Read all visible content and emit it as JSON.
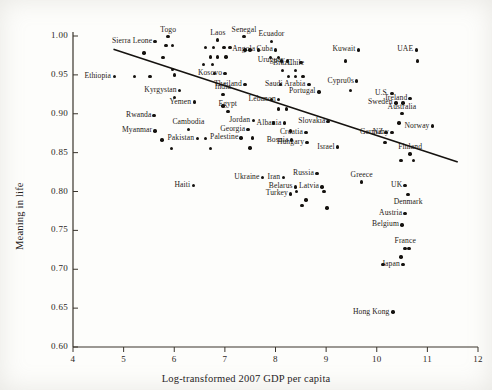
{
  "chart_data": {
    "type": "scatter",
    "title": "",
    "xlabel": "Log-transformed 2007 GDP per capita",
    "ylabel": "Meaning in life",
    "xlim": [
      4,
      12
    ],
    "ylim": [
      0.6,
      1.0
    ],
    "xticks": [
      "4",
      "5",
      "6",
      "7",
      "8",
      "9",
      "10",
      "11",
      "12"
    ],
    "yticks": [
      "0.60",
      "0.65",
      "0.70",
      "0.75",
      "0.80",
      "0.85",
      "0.90",
      "0.95",
      "1.00"
    ],
    "grid": false,
    "legend": "none",
    "trendline": {
      "x0": 4.8,
      "y0": 0.983,
      "x1": 11.6,
      "y1": 0.838,
      "color": "#15120f"
    },
    "points": [
      {
        "label": "Ethiopia",
        "x": 4.82,
        "y": 0.948,
        "lp": "left"
      },
      {
        "label": "",
        "x": 5.22,
        "y": 0.948,
        "lp": "none"
      },
      {
        "label": "",
        "x": 5.52,
        "y": 0.948,
        "lp": "none"
      },
      {
        "label": "Sierra Leone",
        "x": 5.62,
        "y": 0.993,
        "lp": "left"
      },
      {
        "label": "Togo",
        "x": 5.88,
        "y": 0.999,
        "lp": "top"
      },
      {
        "label": "",
        "x": 5.84,
        "y": 0.988,
        "lp": "none"
      },
      {
        "label": "",
        "x": 5.96,
        "y": 0.988,
        "lp": "none"
      },
      {
        "label": "",
        "x": 5.4,
        "y": 0.978,
        "lp": "none"
      },
      {
        "label": "",
        "x": 5.78,
        "y": 0.972,
        "lp": "none"
      },
      {
        "label": "",
        "x": 5.96,
        "y": 0.957,
        "lp": "none"
      },
      {
        "label": "",
        "x": 6.0,
        "y": 0.95,
        "lp": "none"
      },
      {
        "label": "Kyrgystan",
        "x": 6.1,
        "y": 0.93,
        "lp": "left"
      },
      {
        "label": "",
        "x": 6.0,
        "y": 0.921,
        "lp": "none"
      },
      {
        "label": "Yemen",
        "x": 6.4,
        "y": 0.915,
        "lp": "left"
      },
      {
        "label": "Rwanda",
        "x": 5.6,
        "y": 0.898,
        "lp": "left"
      },
      {
        "label": "Myanmar",
        "x": 5.62,
        "y": 0.878,
        "lp": "left"
      },
      {
        "label": "",
        "x": 5.76,
        "y": 0.866,
        "lp": "none"
      },
      {
        "label": "",
        "x": 5.94,
        "y": 0.855,
        "lp": "none"
      },
      {
        "label": "Cambodia",
        "x": 6.28,
        "y": 0.88,
        "lp": "top"
      },
      {
        "label": "Pakistan",
        "x": 6.46,
        "y": 0.868,
        "lp": "left"
      },
      {
        "label": "",
        "x": 6.62,
        "y": 0.868,
        "lp": "none"
      },
      {
        "label": "",
        "x": 6.72,
        "y": 0.855,
        "lp": "none"
      },
      {
        "label": "Haiti",
        "x": 6.38,
        "y": 0.808,
        "lp": "left"
      },
      {
        "label": "Laos",
        "x": 6.86,
        "y": 0.995,
        "lp": "top"
      },
      {
        "label": "",
        "x": 6.62,
        "y": 0.985,
        "lp": "none"
      },
      {
        "label": "",
        "x": 6.78,
        "y": 0.985,
        "lp": "none"
      },
      {
        "label": "",
        "x": 6.98,
        "y": 0.985,
        "lp": "none"
      },
      {
        "label": "",
        "x": 7.1,
        "y": 0.985,
        "lp": "none"
      },
      {
        "label": "",
        "x": 6.72,
        "y": 0.973,
        "lp": "none"
      },
      {
        "label": "",
        "x": 6.86,
        "y": 0.973,
        "lp": "none"
      },
      {
        "label": "",
        "x": 7.02,
        "y": 0.973,
        "lp": "none"
      },
      {
        "label": "",
        "x": 6.58,
        "y": 0.963,
        "lp": "none"
      },
      {
        "label": "",
        "x": 6.76,
        "y": 0.963,
        "lp": "none"
      },
      {
        "label": "Kosovo",
        "x": 7.0,
        "y": 0.952,
        "lp": "left"
      },
      {
        "label": "",
        "x": 6.8,
        "y": 0.952,
        "lp": "none"
      },
      {
        "label": "Thailand",
        "x": 7.4,
        "y": 0.938,
        "lp": "left"
      },
      {
        "label": "India",
        "x": 6.96,
        "y": 0.925,
        "lp": "top"
      },
      {
        "label": "",
        "x": 6.96,
        "y": 0.91,
        "lp": "none"
      },
      {
        "label": "Egypt",
        "x": 7.06,
        "y": 0.903,
        "lp": "top"
      },
      {
        "label": "Georgia",
        "x": 7.46,
        "y": 0.88,
        "lp": "left"
      },
      {
        "label": "Palestine",
        "x": 7.32,
        "y": 0.869,
        "lp": "left"
      },
      {
        "label": "",
        "x": 7.54,
        "y": 0.869,
        "lp": "none"
      },
      {
        "label": "",
        "x": 7.5,
        "y": 0.856,
        "lp": "none"
      },
      {
        "label": "Jordan",
        "x": 7.56,
        "y": 0.891,
        "lp": "left"
      },
      {
        "label": "Senegal",
        "x": 7.38,
        "y": 0.999,
        "lp": "top"
      },
      {
        "label": "Angola",
        "x": 7.66,
        "y": 0.982,
        "lp": "left"
      },
      {
        "label": "",
        "x": 7.4,
        "y": 0.982,
        "lp": "none"
      },
      {
        "label": "",
        "x": 7.5,
        "y": 0.982,
        "lp": "none"
      },
      {
        "label": "Ecuador",
        "x": 7.92,
        "y": 0.993,
        "lp": "top"
      },
      {
        "label": "Cuba",
        "x": 8.0,
        "y": 0.982,
        "lp": "left"
      },
      {
        "label": "",
        "x": 7.9,
        "y": 0.972,
        "lp": "none"
      },
      {
        "label": "",
        "x": 8.06,
        "y": 0.972,
        "lp": "none"
      },
      {
        "label": "Uruguay",
        "x": 8.24,
        "y": 0.968,
        "lp": "left"
      },
      {
        "label": "",
        "x": 8.12,
        "y": 0.968,
        "lp": "none"
      },
      {
        "label": "",
        "x": 8.5,
        "y": 0.966,
        "lp": "none"
      },
      {
        "label": "Brazil",
        "x": 8.14,
        "y": 0.956,
        "lp": "top"
      },
      {
        "label": "Chile",
        "x": 8.4,
        "y": 0.956,
        "lp": "top"
      },
      {
        "label": "",
        "x": 8.26,
        "y": 0.948,
        "lp": "none"
      },
      {
        "label": "",
        "x": 8.4,
        "y": 0.948,
        "lp": "none"
      },
      {
        "label": "",
        "x": 8.54,
        "y": 0.948,
        "lp": "none"
      },
      {
        "label": "Saudi Arabia",
        "x": 8.66,
        "y": 0.938,
        "lp": "left"
      },
      {
        "label": "",
        "x": 8.1,
        "y": 0.938,
        "lp": "none"
      },
      {
        "label": "Portugal",
        "x": 8.86,
        "y": 0.928,
        "lp": "left"
      },
      {
        "label": "Lebanon",
        "x": 8.06,
        "y": 0.918,
        "lp": "left"
      },
      {
        "label": "",
        "x": 7.92,
        "y": 0.918,
        "lp": "none"
      },
      {
        "label": "",
        "x": 8.06,
        "y": 0.906,
        "lp": "none"
      },
      {
        "label": "",
        "x": 8.22,
        "y": 0.906,
        "lp": "none"
      },
      {
        "label": "Albania",
        "x": 8.18,
        "y": 0.888,
        "lp": "left"
      },
      {
        "label": "",
        "x": 7.96,
        "y": 0.888,
        "lp": "none"
      },
      {
        "label": "",
        "x": 8.3,
        "y": 0.878,
        "lp": "none"
      },
      {
        "label": "Bosnia",
        "x": 8.32,
        "y": 0.866,
        "lp": "left"
      },
      {
        "label": "Croatia",
        "x": 8.6,
        "y": 0.876,
        "lp": "left"
      },
      {
        "label": "Hungary",
        "x": 8.62,
        "y": 0.863,
        "lp": "left"
      },
      {
        "label": "Slovakia",
        "x": 9.04,
        "y": 0.89,
        "lp": "left"
      },
      {
        "label": "Israel",
        "x": 9.22,
        "y": 0.857,
        "lp": "left"
      },
      {
        "label": "Kuwait",
        "x": 9.64,
        "y": 0.982,
        "lp": "left"
      },
      {
        "label": "",
        "x": 9.38,
        "y": 0.968,
        "lp": "none"
      },
      {
        "label": "Cypru0s",
        "x": 9.6,
        "y": 0.942,
        "lp": "left"
      },
      {
        "label": "",
        "x": 9.48,
        "y": 0.93,
        "lp": "none"
      },
      {
        "label": "U.S.",
        "x": 10.3,
        "y": 0.926,
        "lp": "left"
      },
      {
        "label": "Sweden",
        "x": 10.38,
        "y": 0.914,
        "lp": "left"
      },
      {
        "label": "",
        "x": 10.52,
        "y": 0.914,
        "lp": "none"
      },
      {
        "label": "Ireland",
        "x": 10.66,
        "y": 0.92,
        "lp": "left"
      },
      {
        "label": "Australia",
        "x": 10.5,
        "y": 0.9,
        "lp": "top"
      },
      {
        "label": "",
        "x": 10.44,
        "y": 0.888,
        "lp": "none"
      },
      {
        "label": "Norway",
        "x": 11.1,
        "y": 0.884,
        "lp": "left"
      },
      {
        "label": "UAE",
        "x": 10.78,
        "y": 0.982,
        "lp": "left"
      },
      {
        "label": "",
        "x": 10.8,
        "y": 0.968,
        "lp": "none"
      },
      {
        "label": "NZ",
        "x": 10.18,
        "y": 0.876,
        "lp": "left"
      },
      {
        "label": "Germany",
        "x": 10.3,
        "y": 0.876,
        "lp": "left"
      },
      {
        "label": "",
        "x": 10.16,
        "y": 0.863,
        "lp": "none"
      },
      {
        "label": "Finland",
        "x": 10.66,
        "y": 0.848,
        "lp": "top"
      },
      {
        "label": "",
        "x": 10.48,
        "y": 0.84,
        "lp": "none"
      },
      {
        "label": "",
        "x": 10.72,
        "y": 0.84,
        "lp": "none"
      },
      {
        "label": "Ukraine",
        "x": 7.74,
        "y": 0.818,
        "lp": "left"
      },
      {
        "label": "Iran",
        "x": 8.16,
        "y": 0.818,
        "lp": "left"
      },
      {
        "label": "Russia",
        "x": 8.82,
        "y": 0.823,
        "lp": "left"
      },
      {
        "label": "Belarus",
        "x": 8.4,
        "y": 0.806,
        "lp": "left"
      },
      {
        "label": "Latvia",
        "x": 8.92,
        "y": 0.806,
        "lp": "left"
      },
      {
        "label": "Greece",
        "x": 9.7,
        "y": 0.812,
        "lp": "top"
      },
      {
        "label": "UK",
        "x": 10.56,
        "y": 0.808,
        "lp": "left"
      },
      {
        "label": "Denmark",
        "x": 10.62,
        "y": 0.796,
        "lp": "bottom"
      },
      {
        "label": "Turkey",
        "x": 8.3,
        "y": 0.797,
        "lp": "left"
      },
      {
        "label": "",
        "x": 8.42,
        "y": 0.8,
        "lp": "none"
      },
      {
        "label": "",
        "x": 8.96,
        "y": 0.8,
        "lp": "none"
      },
      {
        "label": "",
        "x": 8.6,
        "y": 0.789,
        "lp": "none"
      },
      {
        "label": "",
        "x": 8.52,
        "y": 0.782,
        "lp": "none"
      },
      {
        "label": "",
        "x": 9.02,
        "y": 0.779,
        "lp": "none"
      },
      {
        "label": "Austria",
        "x": 10.56,
        "y": 0.772,
        "lp": "left"
      },
      {
        "label": "Belgium",
        "x": 10.5,
        "y": 0.757,
        "lp": "left"
      },
      {
        "label": "France",
        "x": 10.56,
        "y": 0.727,
        "lp": "top"
      },
      {
        "label": "",
        "x": 10.64,
        "y": 0.727,
        "lp": "none"
      },
      {
        "label": "",
        "x": 10.48,
        "y": 0.716,
        "lp": "none"
      },
      {
        "label": "Japan",
        "x": 10.52,
        "y": 0.706,
        "lp": "left"
      },
      {
        "label": "",
        "x": 10.12,
        "y": 0.706,
        "lp": "none"
      },
      {
        "label": "Hong Kong",
        "x": 10.32,
        "y": 0.645,
        "lp": "left"
      }
    ]
  }
}
